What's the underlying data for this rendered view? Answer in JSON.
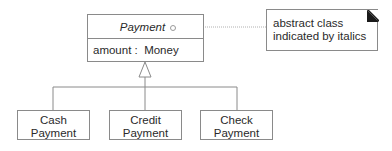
{
  "diagram": {
    "type": "UML class diagram",
    "superclass": {
      "name": "Payment",
      "name_style": "italic",
      "attributes": [
        "amount :  Money"
      ]
    },
    "subclasses": [
      {
        "line1": "Cash",
        "line2": "Payment"
      },
      {
        "line1": "Credit",
        "line2": "Payment"
      },
      {
        "line1": "Check",
        "line2": "Payment"
      }
    ],
    "note": {
      "line1": "abstract class",
      "line2": "indicated by italics"
    },
    "relationship": "generalization",
    "colors": {
      "line": "#8a8a8a",
      "text": "#2a2a2a",
      "note_corner": "#1a1a1a"
    }
  }
}
